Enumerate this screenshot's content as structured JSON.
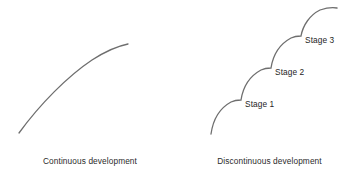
{
  "figure": {
    "background_color": "#ffffff",
    "stroke_color": "#6e6e6e",
    "text_color": "#2b2b2b"
  },
  "panels": {
    "continuous": {
      "caption": "Continuous development",
      "curve_name": "smooth-increasing-curve",
      "path": "M 19 133 C 40 104, 68 76, 92 60 C 106 51, 118 46, 128 44"
    },
    "discontinuous": {
      "caption": "Discontinuous development",
      "curve_name": "staircase-step-curve",
      "path": "M 211 134 C 213 120, 220 108, 231 102 C 235 100, 238 100, 241 100 C 243 87, 250 76, 261 70 C 265 68, 268 68, 271 68 C 273 55, 280 44, 291 38 C 295 36, 298 36, 301 36 C 303 25, 310 15, 320 10 C 326 8, 332 7, 337 8",
      "stages": [
        {
          "label": "Stage 1",
          "x": 65,
          "y": 99
        },
        {
          "label": "Stage 2",
          "x": 95,
          "y": 67
        },
        {
          "label": "Stage 3",
          "x": 125,
          "y": 35
        }
      ]
    }
  }
}
